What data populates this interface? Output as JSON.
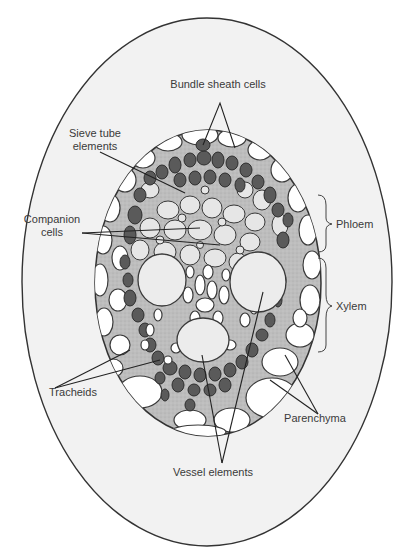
{
  "figure": {
    "type": "cross-section diagram",
    "colors": {
      "background": "#ffffff",
      "outer_ellipse_fill": "#f2f2f2",
      "outline": "#333333",
      "matrix_fill": "#bdbdbd",
      "dark_cells": "#5a5a5a",
      "light_cells": "#e6e6e6",
      "parenchyma_cells": "#ffffff",
      "label_text": "#3a3a3a"
    }
  },
  "labels": {
    "bundle_sheath": "Bundle sheath cells",
    "sieve_tube_line1": "Sieve tube",
    "sieve_tube_line2": "elements",
    "companion_line1": "Companion",
    "companion_line2": "cells",
    "phloem": "Phloem",
    "xylem": "Xylem",
    "tracheids": "Tracheids",
    "parenchyma": "Parenchyma",
    "vessel_elements": "Vessel elements"
  }
}
